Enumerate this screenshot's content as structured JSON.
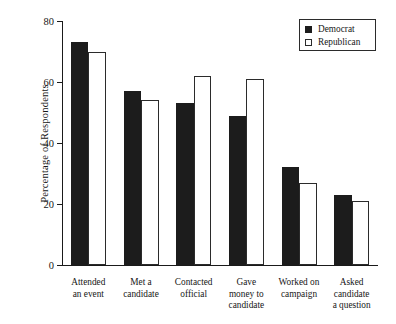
{
  "chart_data": {
    "type": "bar",
    "title": "",
    "xlabel": "",
    "ylabel": "Percentage of Respondents",
    "ylim": [
      0,
      80
    ],
    "yticks": [
      0,
      20,
      40,
      60,
      80
    ],
    "grid": false,
    "legend_position": "top-right",
    "categories": [
      "Attended an event",
      "Met a candidate",
      "Contacted official",
      "Gave money to candidate",
      "Worked on campaign",
      "Asked candidate a question"
    ],
    "category_lines": [
      [
        "Attended",
        "an event"
      ],
      [
        "Met a",
        "candidate"
      ],
      [
        "Contacted",
        "official"
      ],
      [
        "Gave",
        "money to",
        "candidate"
      ],
      [
        "Worked on",
        "campaign"
      ],
      [
        "Asked",
        "candidate",
        "a question"
      ]
    ],
    "series": [
      {
        "name": "Democrat",
        "color": "#1c1c1c",
        "values": [
          73,
          57,
          53,
          49,
          32,
          23
        ]
      },
      {
        "name": "Republican",
        "color": "#ffffff",
        "values": [
          70,
          54,
          62,
          61,
          27,
          21
        ]
      }
    ]
  },
  "legend": {
    "items": [
      {
        "label": "Democrat",
        "swatch": "filled-square-icon"
      },
      {
        "label": "Republican",
        "swatch": "outlined-square-icon"
      }
    ]
  },
  "caption": {
    "text": " "
  }
}
